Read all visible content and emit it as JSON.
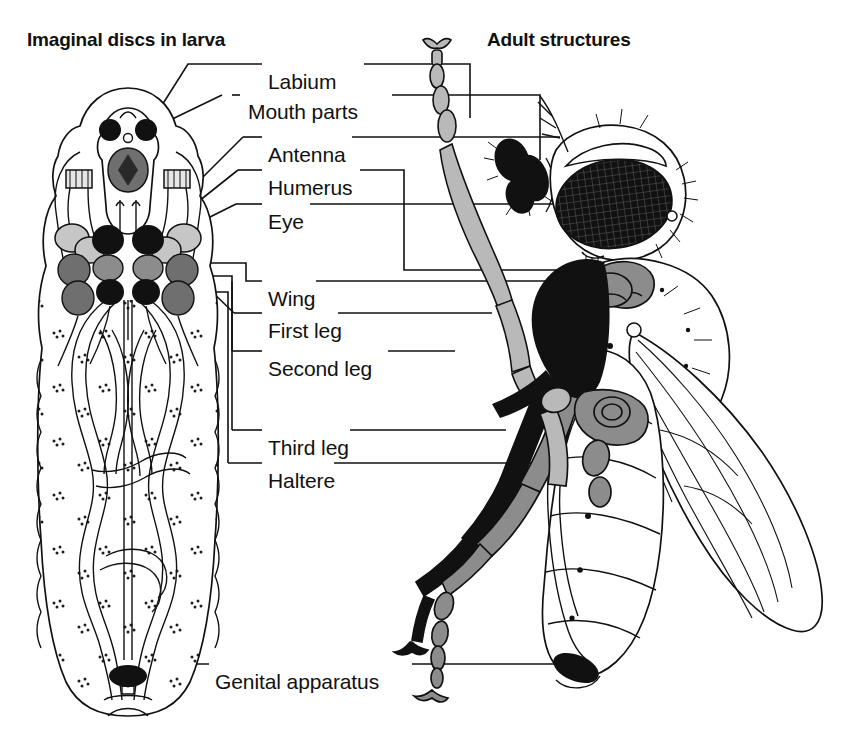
{
  "headings": {
    "larva": "Imaginal discs in larva",
    "adult": "Adult structures"
  },
  "labels": [
    {
      "id": "labium",
      "text": "Labium",
      "x": 268,
      "y": 70
    },
    {
      "id": "mouth-parts",
      "text": "Mouth parts",
      "x": 248,
      "y": 100
    },
    {
      "id": "antenna",
      "text": "Antenna",
      "x": 268,
      "y": 143
    },
    {
      "id": "humerus",
      "text": "Humerus",
      "x": 268,
      "y": 176
    },
    {
      "id": "eye",
      "text": "Eye",
      "x": 268,
      "y": 210
    },
    {
      "id": "wing",
      "text": "Wing",
      "x": 268,
      "y": 287
    },
    {
      "id": "first-leg",
      "text": "First leg",
      "x": 268,
      "y": 319
    },
    {
      "id": "second-leg",
      "text": "Second leg",
      "x": 268,
      "y": 357
    },
    {
      "id": "third-leg",
      "text": "Third leg",
      "x": 268,
      "y": 436
    },
    {
      "id": "haltere",
      "text": "Haltere",
      "x": 268,
      "y": 469
    },
    {
      "id": "genital-apparatus",
      "text": "Genital apparatus",
      "x": 215,
      "y": 670
    }
  ],
  "colors": {
    "ink": "#111111",
    "background": "#ffffff",
    "disc_black": "#111111",
    "disc_dark_gray": "#6f6f6f",
    "disc_mid_gray": "#8c8c8c",
    "disc_light_gray": "#c6c6c6",
    "wing_membrane": "#fdfdfd"
  },
  "figure": {
    "type": "labelled-biological-diagram",
    "panels": [
      {
        "name": "larva",
        "description": "Third-instar larva in dorsal view with paired imaginal discs shaded"
      },
      {
        "name": "adult",
        "description": "Adult fly in lateral view with corresponding structures shaded"
      }
    ],
    "shading_key": [
      {
        "structure": "Labium",
        "tone": "dark"
      },
      {
        "structure": "Mouth parts",
        "tone": "black"
      },
      {
        "structure": "Antenna",
        "tone": "light"
      },
      {
        "structure": "Humerus",
        "tone": "mid"
      },
      {
        "structure": "Eye",
        "tone": "black"
      },
      {
        "structure": "Wing",
        "tone": "outline"
      },
      {
        "structure": "First leg",
        "tone": "light"
      },
      {
        "structure": "Second leg",
        "tone": "black"
      },
      {
        "structure": "Third leg",
        "tone": "mid"
      },
      {
        "structure": "Haltere",
        "tone": "mid"
      },
      {
        "structure": "Genital apparatus",
        "tone": "black"
      }
    ]
  }
}
